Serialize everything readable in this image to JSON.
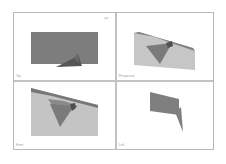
{
  "viewports": [
    {
      "id": "top",
      "label": "Top"
    },
    {
      "id": "perspective",
      "label": "Perspective"
    },
    {
      "id": "front",
      "label": "Front"
    },
    {
      "id": "left",
      "label": "Left"
    }
  ],
  "axis_gizmo": {
    "label": "xyz"
  },
  "colors": {
    "background": "#ffffff",
    "frame_border": "#b8b8b8",
    "divider": "#c2c2c2",
    "face_dark": "#7a7a7a",
    "face_mid": "#8c8c8c",
    "face_light": "#c4c4c4",
    "face_darkest": "#4f4f4f"
  }
}
